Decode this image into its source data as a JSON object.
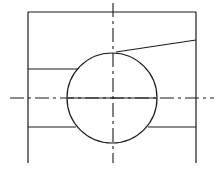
{
  "drawing": {
    "type": "technical-section-view",
    "stroke_color": "#1a1a1a",
    "background": "#ffffff",
    "frame": {
      "left": 28,
      "right": 196,
      "top": 12,
      "bottom": 163
    },
    "circle": {
      "cx": 112,
      "cy": 98,
      "r": 45
    },
    "centerlines": {
      "horizontal": {
        "y": 98,
        "x1": 10,
        "x2": 214
      },
      "vertical": {
        "x": 113,
        "y1": 3,
        "y2": 163
      }
    },
    "sloped_line": {
      "x1": 116,
      "y1": 51,
      "x2": 196,
      "y2": 40
    },
    "horizontal_lines": [
      {
        "y": 69,
        "x1": 28,
        "x2": 78
      },
      {
        "y": 127,
        "x1": 28,
        "x2": 76
      },
      {
        "y": 127,
        "x1": 148,
        "x2": 196
      }
    ]
  }
}
